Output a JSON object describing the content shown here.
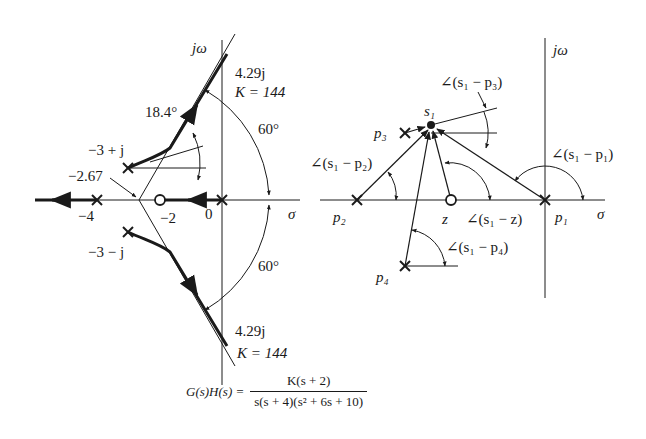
{
  "left_plot": {
    "axis_labels": {
      "imag": "jω",
      "real": "σ"
    },
    "tick_labels": {
      "minus4": "−4",
      "minus2": "−2",
      "zero": "0"
    },
    "pole_labels": {
      "upper": "−3 + j",
      "lower": "−3 − j"
    },
    "centroid_label": "−2.67",
    "departure_angle": "18.4°",
    "asymptote_angle_upper": "60°",
    "asymptote_angle_lower": "60°",
    "crossing_upper": {
      "freq": "4.29j",
      "gain": "K = 144"
    },
    "crossing_lower": {
      "freq": "4.29j",
      "gain": "K = 144"
    }
  },
  "right_plot": {
    "axis_labels": {
      "imag": "jω",
      "real": "σ"
    },
    "point_labels": {
      "s1": "s₁",
      "p1": "p₁",
      "p2": "p₂",
      "p3": "p₃",
      "p4": "p₄",
      "z": "z"
    },
    "angle_labels": {
      "p1": "∠(s₁ − p₁)",
      "p2": "∠(s₁ − p₂)",
      "p3": "∠(s₁ − p₃)",
      "p4": "∠(s₁ − p₄)",
      "z": "∠(s₁ − z)"
    }
  },
  "formula": {
    "lhs": "G(s)H(s) =",
    "numerator": "K(s + 2)",
    "denominator": "s(s + 4)(s² + 6s + 10)"
  }
}
